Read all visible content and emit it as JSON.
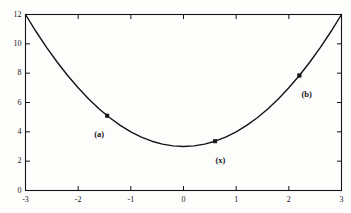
{
  "chart_data": {
    "type": "line",
    "title": "",
    "subtitle": "",
    "xlabel": "",
    "ylabel": "",
    "xlim": [
      -3,
      3
    ],
    "ylim": [
      0,
      12
    ],
    "grid": false,
    "legend": null,
    "curve": {
      "name": "f(x) = x^2 + 3",
      "expression": "x^2 + 3",
      "x": [
        -3,
        -2.8,
        -2.6,
        -2.4,
        -2.2,
        -2,
        -1.8,
        -1.6,
        -1.4,
        -1.2,
        -1,
        -0.8,
        -0.6,
        -0.4,
        -0.2,
        0,
        0.2,
        0.4,
        0.6,
        0.8,
        1,
        1.2,
        1.4,
        1.6,
        1.8,
        2,
        2.2,
        2.4,
        2.6,
        2.8,
        3
      ],
      "y": [
        12,
        10.84,
        9.76,
        8.76,
        7.84,
        7,
        6.24,
        5.56,
        4.96,
        4.44,
        4,
        3.64,
        3.36,
        3.16,
        3.04,
        3,
        3.04,
        3.16,
        3.36,
        3.64,
        4,
        4.44,
        4.96,
        5.56,
        6.24,
        7,
        7.84,
        8.76,
        9.76,
        10.84,
        12
      ],
      "color": "#141417",
      "linewidth": 1.4
    },
    "markers": [
      {
        "label": "(a)",
        "x": -1.45,
        "y": 5.1,
        "label_dx": -0.15,
        "label_dy": -1.25,
        "marker": "square"
      },
      {
        "label": "(x)",
        "x": 0.6,
        "y": 3.36,
        "label_dx": 0.1,
        "label_dy": -1.3,
        "marker": "square"
      },
      {
        "label": "(b)",
        "x": 2.2,
        "y": 7.84,
        "label_dx": 0.14,
        "label_dy": -1.25,
        "marker": "square"
      }
    ],
    "xticks": [
      -3,
      -2,
      -1,
      0,
      1,
      2,
      3
    ],
    "xticklabels": [
      "-3",
      "-2",
      "-1",
      "0",
      "1",
      "2",
      "3"
    ],
    "yticks": [
      0,
      2,
      4,
      6,
      8,
      10,
      12
    ],
    "yticklabels": [
      "0",
      "2",
      "4",
      "6",
      "8",
      "10",
      "12"
    ],
    "tick_direction": "in",
    "frame": "box",
    "axis_color": "#141417",
    "background_color": "#fdfdfb"
  }
}
